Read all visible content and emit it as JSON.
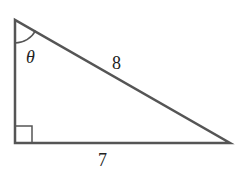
{
  "diagram": {
    "type": "right-triangle",
    "colors": {
      "stroke": "#555555",
      "text": "#222222",
      "background": "#ffffff"
    },
    "vertices": {
      "top": [
        15,
        20
      ],
      "right_angle": [
        15,
        143
      ],
      "right": [
        230,
        143
      ]
    },
    "labels": {
      "angle": "θ",
      "hypotenuse": "8",
      "base": "7"
    },
    "angle_marker": "arc at top vertex",
    "right_angle_marker": "square at bottom-left vertex"
  }
}
